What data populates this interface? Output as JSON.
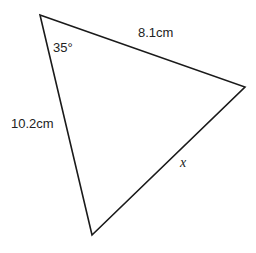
{
  "diagram": {
    "type": "triangle",
    "vertices": {
      "top": [
        40,
        15
      ],
      "right": [
        245,
        87
      ],
      "bottom": [
        92,
        235
      ]
    },
    "stroke_color": "#1a1a1a",
    "labels": {
      "side_top": "8.1cm",
      "side_left": "10.2cm",
      "side_right": "x",
      "angle_top": "35°"
    }
  }
}
